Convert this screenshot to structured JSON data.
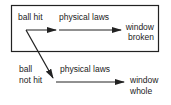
{
  "diagram": {
    "box_label": "actual world",
    "nodes": {
      "ball_hit": "ball hit",
      "ball_not_hit_line1": "ball",
      "ball_not_hit_line2": "not hit",
      "window_broken_line1": "window",
      "window_broken_line2": "broken",
      "window_whole_line1": "window",
      "window_whole_line2": "whole"
    },
    "edges": {
      "top_law": "physical laws",
      "bottom_law": "physical laws"
    },
    "colors": {
      "stroke": "#222222",
      "background": "#ffffff"
    }
  }
}
